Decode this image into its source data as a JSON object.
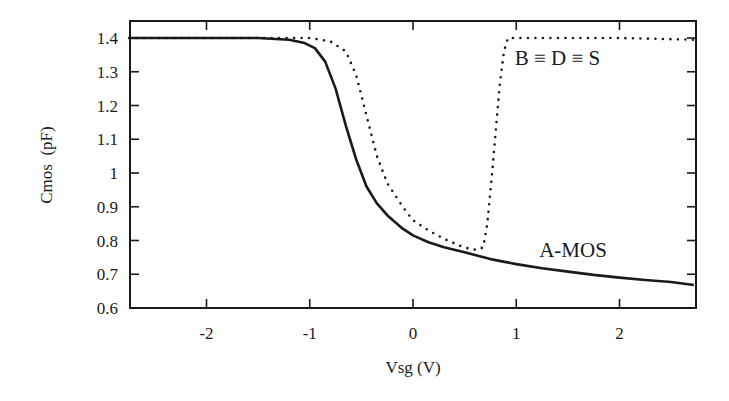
{
  "chart_data": {
    "type": "line",
    "title": "",
    "xlabel": "Vsg (V)",
    "ylabel": "Cmos  (pF)",
    "xlim": [
      -2.75,
      2.73
    ],
    "ylim": [
      0.6,
      1.45
    ],
    "grid": false,
    "legend": "none (inline annotations)",
    "xticks": [
      -2,
      -1,
      0,
      1,
      2
    ],
    "xtick_labels": [
      "-2",
      "-1",
      "0",
      "1",
      "2"
    ],
    "yticks": [
      0.6,
      0.7,
      0.8,
      0.9,
      1.0,
      1.1,
      1.2,
      1.3,
      1.4
    ],
    "ytick_labels": [
      "0.6",
      "0.7",
      "0.8",
      "0.9",
      "1",
      "1.1",
      "1.2",
      "1.3",
      "1.4"
    ],
    "annotations": [
      {
        "text": "B ≡ D ≡ S",
        "x": 1.4,
        "y": 1.32
      },
      {
        "text": "A-MOS",
        "x": 1.55,
        "y": 0.75
      }
    ],
    "series": [
      {
        "name": "A-MOS",
        "style": "solid",
        "x": [
          -2.75,
          -2.0,
          -1.5,
          -1.2,
          -1.05,
          -0.95,
          -0.85,
          -0.75,
          -0.65,
          -0.55,
          -0.45,
          -0.35,
          -0.25,
          -0.1,
          0.0,
          0.15,
          0.3,
          0.5,
          0.75,
          1.0,
          1.25,
          1.5,
          1.75,
          2.0,
          2.25,
          2.5,
          2.72
        ],
        "y": [
          1.4,
          1.4,
          1.4,
          1.395,
          1.385,
          1.37,
          1.33,
          1.25,
          1.14,
          1.04,
          0.96,
          0.91,
          0.875,
          0.835,
          0.815,
          0.795,
          0.78,
          0.765,
          0.745,
          0.73,
          0.718,
          0.708,
          0.698,
          0.69,
          0.683,
          0.677,
          0.668
        ]
      },
      {
        "name": "B ≡ D ≡ S",
        "style": "dotted",
        "x": [
          -2.75,
          -1.5,
          -1.0,
          -0.8,
          -0.65,
          -0.55,
          -0.45,
          -0.35,
          -0.25,
          -0.1,
          0.0,
          0.15,
          0.3,
          0.45,
          0.55,
          0.62,
          0.68,
          0.72,
          0.76,
          0.8,
          0.84,
          0.88,
          0.92,
          1.0,
          2.0,
          2.72
        ],
        "y": [
          1.4,
          1.4,
          1.4,
          1.39,
          1.36,
          1.29,
          1.17,
          1.05,
          0.97,
          0.9,
          0.86,
          0.83,
          0.805,
          0.785,
          0.775,
          0.772,
          0.78,
          0.85,
          0.98,
          1.12,
          1.26,
          1.36,
          1.4,
          1.4,
          1.4,
          1.395
        ]
      }
    ]
  },
  "plot": {
    "left": 130,
    "top": 21,
    "right": 696,
    "bottom": 308,
    "colors": {
      "axis": "#1a1a1a",
      "line": "#1a1a1a",
      "background": "#ffffff"
    }
  }
}
